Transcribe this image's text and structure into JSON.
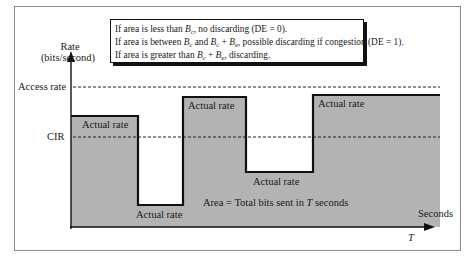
{
  "diagram": {
    "y_axis_label_line1": "Rate",
    "y_axis_label_line2": "(bits/second)",
    "x_axis_label": "Seconds",
    "x_axis_end_label": "T",
    "access_rate_label": "Access rate",
    "cir_label": "CIR",
    "area_caption_prefix": "Area = Total bits sent in ",
    "area_caption_var": "T",
    "area_caption_suffix": " seconds",
    "actual_rate_labels": [
      "Actual rate",
      "Actual rate",
      "Actual rate",
      "Actual rate",
      "Actual rate"
    ],
    "colors": {
      "fill": "#b3b3b3",
      "line": "#111111",
      "frame": "#8a8a8a"
    }
  },
  "note": {
    "line1": {
      "a": "If area is less than ",
      "b": "B",
      "b_sub": "c",
      "c": ", no discarding (DE = 0)."
    },
    "line2": {
      "a": "If area is between ",
      "b": "B",
      "b_sub": "c",
      "c": " and ",
      "d": "B",
      "d_sub": "c",
      "e": " + ",
      "f": "B",
      "f_sub": "e",
      "g": ", possible discarding if congestion (DE = 1)."
    },
    "line3": {
      "a": "If area is greater than ",
      "b": "B",
      "b_sub": "c",
      "c": " + ",
      "d": "B",
      "d_sub": "e",
      "e": ", discarding."
    }
  }
}
